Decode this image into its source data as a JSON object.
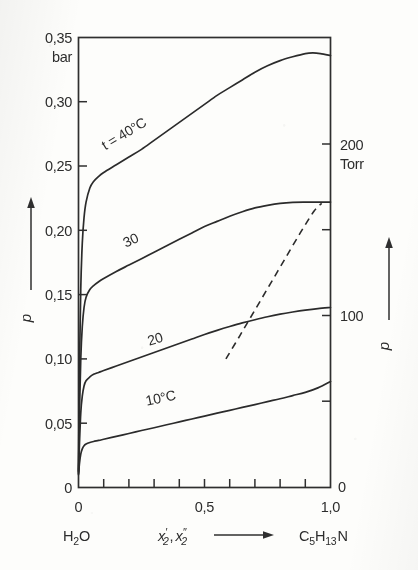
{
  "figure": {
    "background_color": "#fdfdfb",
    "ink_color": "#2b2b2b"
  },
  "axes": {
    "left": {
      "unit": "bar",
      "symbol": "p",
      "tick_labels": [
        "0,35",
        "0,30",
        "0,25",
        "0,20",
        "0,15",
        "0,10",
        "0,05",
        "0"
      ],
      "tick_values": [
        0.35,
        0.3,
        0.25,
        0.2,
        0.15,
        0.1,
        0.05,
        0.0
      ],
      "range": [
        0,
        0.35
      ]
    },
    "right": {
      "unit": "Torr",
      "symbol": "p",
      "tick_labels": [
        "200",
        "100",
        "0"
      ],
      "tick_values": [
        200,
        100,
        0
      ],
      "range": [
        0,
        262.5
      ]
    },
    "bottom": {
      "symbol": "x'₂, x″₂",
      "symbol_base": "x",
      "symbol_sub": "2",
      "tick_labels": [
        "0",
        "0,5",
        "1,0"
      ],
      "tick_values": [
        0,
        0.5,
        1.0
      ],
      "range": [
        0,
        1.0
      ],
      "left_species": "H₂O",
      "left_species_base": "H",
      "left_species_sub": "2",
      "left_species_tail": "O",
      "right_species": "C₅H₁₃N",
      "right_species_parts": [
        "C",
        "5",
        "H",
        "13",
        "N"
      ],
      "arrow": "⟶"
    }
  },
  "curve_labels": [
    {
      "id": "t40",
      "text": "t = 40°C",
      "x": 0.19,
      "y": 0.272,
      "rotation": -31
    },
    {
      "id": "t30",
      "text": "30",
      "x": 0.215,
      "y": 0.189,
      "rotation": -25
    },
    {
      "id": "t20",
      "text": "20",
      "x": 0.31,
      "y": 0.112,
      "rotation": -17
    },
    {
      "id": "t10",
      "text": "10°C",
      "x": 0.33,
      "y": 0.066,
      "rotation": -12
    }
  ],
  "chart_data": {
    "type": "line",
    "title": "",
    "subtitle": "",
    "xlabel": "x'₂, x″₂",
    "ylabel": "p",
    "y2label": "p",
    "xlim": [
      0,
      1.0
    ],
    "ylim": [
      0,
      0.35
    ],
    "y2lim": [
      0,
      262.5
    ],
    "xunit": "mole fraction",
    "yunit": "bar",
    "y2unit": "Torr",
    "grid": false,
    "legend": "inline-curve-labels",
    "x_minor_tick_step": 0.1,
    "y_tick_step": 0.05,
    "series": [
      {
        "name": "t = 40°C",
        "temperature_c": 40,
        "x": [
          0.0,
          0.004,
          0.009,
          0.015,
          0.022,
          0.03,
          0.045,
          0.06,
          0.08,
          0.1,
          0.15,
          0.2,
          0.25,
          0.3,
          0.35,
          0.4,
          0.45,
          0.5,
          0.55,
          0.6,
          0.65,
          0.7,
          0.75,
          0.8,
          0.85,
          0.9,
          0.93,
          0.96,
          1.0
        ],
        "y": [
          0.013,
          0.095,
          0.155,
          0.19,
          0.21,
          0.222,
          0.233,
          0.238,
          0.242,
          0.245,
          0.251,
          0.257,
          0.263,
          0.27,
          0.277,
          0.284,
          0.291,
          0.298,
          0.305,
          0.311,
          0.317,
          0.323,
          0.328,
          0.332,
          0.335,
          0.3375,
          0.338,
          0.3375,
          0.336
        ]
      },
      {
        "name": "30",
        "temperature_c": 30,
        "x": [
          0.0,
          0.004,
          0.009,
          0.015,
          0.022,
          0.03,
          0.045,
          0.06,
          0.08,
          0.1,
          0.15,
          0.2,
          0.25,
          0.3,
          0.35,
          0.4,
          0.45,
          0.5,
          0.55,
          0.6,
          0.65,
          0.7,
          0.75,
          0.8,
          0.85,
          0.9,
          0.95,
          1.0
        ],
        "y": [
          0.012,
          0.06,
          0.1,
          0.125,
          0.14,
          0.148,
          0.154,
          0.157,
          0.16,
          0.1625,
          0.168,
          0.173,
          0.178,
          0.183,
          0.188,
          0.193,
          0.198,
          0.203,
          0.207,
          0.211,
          0.2145,
          0.2175,
          0.2195,
          0.221,
          0.2218,
          0.222,
          0.222,
          0.222
        ]
      },
      {
        "name": "20",
        "temperature_c": 20,
        "x": [
          0.0,
          0.004,
          0.009,
          0.015,
          0.022,
          0.03,
          0.045,
          0.06,
          0.08,
          0.1,
          0.15,
          0.2,
          0.25,
          0.3,
          0.35,
          0.4,
          0.45,
          0.5,
          0.55,
          0.6,
          0.65,
          0.7,
          0.75,
          0.8,
          0.85,
          0.9,
          0.95,
          1.0
        ],
        "y": [
          0.011,
          0.035,
          0.058,
          0.071,
          0.079,
          0.083,
          0.086,
          0.088,
          0.0895,
          0.091,
          0.0945,
          0.098,
          0.1015,
          0.105,
          0.1085,
          0.112,
          0.1155,
          0.119,
          0.1222,
          0.1252,
          0.128,
          0.1305,
          0.1328,
          0.1348,
          0.1365,
          0.138,
          0.1392,
          0.14
        ]
      },
      {
        "name": "10°C",
        "temperature_c": 10,
        "x": [
          0.0,
          0.004,
          0.009,
          0.015,
          0.022,
          0.03,
          0.045,
          0.06,
          0.08,
          0.1,
          0.15,
          0.2,
          0.25,
          0.3,
          0.35,
          0.4,
          0.45,
          0.5,
          0.55,
          0.6,
          0.65,
          0.7,
          0.75,
          0.8,
          0.85,
          0.9,
          0.95,
          1.0
        ],
        "y": [
          0.01,
          0.019,
          0.026,
          0.03,
          0.0325,
          0.0338,
          0.035,
          0.0358,
          0.0366,
          0.0375,
          0.0398,
          0.042,
          0.0443,
          0.0465,
          0.0488,
          0.051,
          0.0533,
          0.0555,
          0.0578,
          0.06,
          0.0623,
          0.0645,
          0.0668,
          0.069,
          0.0715,
          0.074,
          0.0775,
          0.0825
        ]
      }
    ],
    "auxiliary_lines": [
      {
        "name": "dashed-tie-locus",
        "style": "dashed",
        "x": [
          0.585,
          0.64,
          0.7,
          0.76,
          0.82,
          0.88,
          0.935,
          0.965
        ],
        "y": [
          0.1,
          0.118,
          0.138,
          0.158,
          0.178,
          0.198,
          0.215,
          0.221
        ]
      }
    ]
  }
}
